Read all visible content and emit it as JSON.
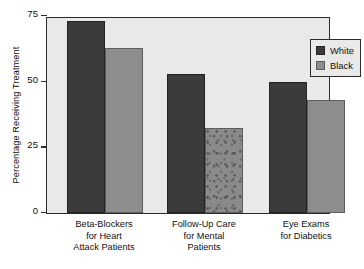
{
  "chart_data": {
    "type": "bar",
    "title": "",
    "xlabel": "",
    "ylabel": "Percentage Receiving Treatment",
    "ylim": [
      0,
      75
    ],
    "yticks": [
      0,
      25,
      50,
      75
    ],
    "ytick_labels": [
      "0",
      "25",
      "50",
      "75"
    ],
    "grid": false,
    "legend_position": "top-right",
    "categories": [
      "Beta-Blockers for Heart Attack Patients",
      "Follow-Up Care for Mental Patients",
      "Eye Exams for Diabetics"
    ],
    "category_lines": [
      [
        "Beta-Blockers",
        "for Heart",
        "Attack Patients"
      ],
      [
        "Follow-Up Care",
        "for Mental",
        "Patients"
      ],
      [
        "Eye Exams",
        "for Diabetics"
      ]
    ],
    "series": [
      {
        "name": "White",
        "color": "#3b3b3b",
        "values": [
          73,
          53,
          50
        ]
      },
      {
        "name": "Black",
        "color": "#8d8d8d",
        "values": [
          63,
          32.5,
          43
        ]
      }
    ]
  },
  "legend": {
    "items": [
      {
        "label": "White",
        "swatch": "white-series"
      },
      {
        "label": "Black",
        "swatch": "black-series"
      }
    ]
  },
  "axis": {
    "y_title": "Percentage Receiving Treatment",
    "y_labels": [
      "75",
      "50",
      "25",
      "0"
    ]
  },
  "colors": {
    "series_white": "#3b3b3b",
    "series_black": "#8d8d8d",
    "plot_background": "#e9e9e9",
    "frame": "#2b2b2b",
    "page_background": "#ffffff",
    "text": "#111111"
  }
}
